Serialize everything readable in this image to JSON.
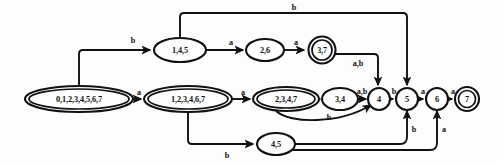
{
  "figure": {
    "colors": {
      "stroke": "#111111",
      "fill": "#ffffff",
      "background": "#fdfdfc"
    }
  },
  "alphabet": [
    "a",
    "b"
  ],
  "nodes": [
    {
      "id": "n0",
      "label": "0,1,2,3,4,5,6,7",
      "shape": "double-ellipse",
      "accepting": true,
      "cx": 79,
      "cy": 99,
      "rx": 54,
      "ry": 13
    },
    {
      "id": "n1",
      "label": "1,2,3,4,6,7",
      "shape": "double-ellipse",
      "accepting": true,
      "cx": 188,
      "cy": 99,
      "rx": 44,
      "ry": 13
    },
    {
      "id": "n2",
      "label": "2,3,4,7",
      "shape": "double-ellipse",
      "accepting": true,
      "cx": 286,
      "cy": 99,
      "rx": 33,
      "ry": 12
    },
    {
      "id": "n3",
      "label": "3,4",
      "shape": "ellipse",
      "accepting": false,
      "cx": 340,
      "cy": 99,
      "rx": 18,
      "ry": 11
    },
    {
      "id": "n4",
      "label": "4",
      "shape": "circle",
      "accepting": false,
      "cx": 379,
      "cy": 99,
      "rx": 11,
      "ry": 11
    },
    {
      "id": "n5",
      "label": "5",
      "shape": "circle",
      "accepting": false,
      "cx": 407,
      "cy": 99,
      "rx": 11,
      "ry": 11
    },
    {
      "id": "n6",
      "label": "6",
      "shape": "circle",
      "accepting": false,
      "cx": 437,
      "cy": 99,
      "rx": 11,
      "ry": 11
    },
    {
      "id": "n7",
      "label": "7",
      "shape": "double-circle",
      "accepting": true,
      "cx": 467,
      "cy": 99,
      "rx": 12,
      "ry": 12
    },
    {
      "id": "n8",
      "label": "1,4,5",
      "shape": "ellipse",
      "accepting": false,
      "cx": 180,
      "cy": 50,
      "rx": 26,
      "ry": 12
    },
    {
      "id": "n9",
      "label": "2,6",
      "shape": "ellipse",
      "accepting": false,
      "cx": 265,
      "cy": 50,
      "rx": 19,
      "ry": 11
    },
    {
      "id": "n10",
      "label": "3,7",
      "shape": "double-circle",
      "accepting": true,
      "cx": 322,
      "cy": 50,
      "rx": 14,
      "ry": 13
    },
    {
      "id": "n11",
      "label": "4,5",
      "shape": "ellipse",
      "accepting": false,
      "cx": 276,
      "cy": 144,
      "rx": 19,
      "ry": 11
    }
  ],
  "edges": [
    {
      "id": "e0",
      "from": "n0",
      "to": "n8",
      "label": "b",
      "label_x": 133,
      "label_y": 41
    },
    {
      "id": "e1",
      "from": "n0",
      "to": "n1",
      "label": "a",
      "label_x": 139,
      "label_y": 93
    },
    {
      "id": "e2",
      "from": "n1",
      "to": "n2",
      "label": "a",
      "label_x": 243,
      "label_y": 93
    },
    {
      "id": "e3",
      "from": "n2",
      "to": "n3",
      "label": "a",
      "label_x": 325,
      "label_y": 93
    },
    {
      "id": "e4",
      "from": "n3",
      "to": "n4",
      "label": "a,b",
      "label_x": 361,
      "label_y": 91
    },
    {
      "id": "e5",
      "from": "n4",
      "to": "n5",
      "label": "b",
      "label_x": 393,
      "label_y": 92
    },
    {
      "id": "e6",
      "from": "n5",
      "to": "n6",
      "label": "a",
      "label_x": 422,
      "label_y": 92
    },
    {
      "id": "e7",
      "from": "n6",
      "to": "n7",
      "label": "a",
      "label_x": 452,
      "label_y": 92
    },
    {
      "id": "e8",
      "from": "n8",
      "to": "n9",
      "label": "a",
      "label_x": 233,
      "label_y": 43
    },
    {
      "id": "e9",
      "from": "n9",
      "to": "n10",
      "label": "a",
      "label_x": 297,
      "label_y": 43
    },
    {
      "id": "e10",
      "from": "n10",
      "to": "n4",
      "label": "a,b",
      "label_x": 359,
      "label_y": 62
    },
    {
      "id": "e11",
      "from": "n8",
      "to": "n5",
      "label": "b",
      "label_x": 293,
      "label_y": 13
    },
    {
      "id": "e12",
      "from": "n2",
      "to": "n4",
      "label": "b",
      "label_x": 330,
      "label_y": 117
    },
    {
      "id": "e13",
      "from": "n1",
      "to": "n11",
      "label": "b",
      "label_x": 227,
      "label_y": 154
    },
    {
      "id": "e14",
      "from": "n11",
      "to": "n5",
      "label": "b",
      "label_x": 411,
      "label_y": 131
    },
    {
      "id": "e15",
      "from": "n11",
      "to": "n6",
      "label": "a",
      "label_x": 443,
      "label_y": 131
    }
  ],
  "paths": {
    "e0": "M 79 86 L 79 50 L 149 50",
    "e1": "M 133 99 L 141 99",
    "e2": "M 232 99 L 249 99",
    "e3": "M 319 99 L 319 99",
    "e3b": "M 319 99 L 319 99",
    "e4": "M 358 99 L 366 99",
    "e5": "M 390 99 L 394 99",
    "e6": "M 418 99 L 424 99",
    "e7": "M 448 99 L 453 99",
    "e8": "M 206 50 L 243 50",
    "e9": "M 284 50 L 306 50",
    "e10": "M 336 52 L 360 52 L 360 86",
    "e11": "M 180 38 L 180 12 L 407 12 L 407 86",
    "e12": "M 281 111 C 300 125 345 122 371 106",
    "e13": "M 188 112 L 188 144 L 254 144",
    "e14": "M 295 144 L 401 144 L 404 140 L 407 111",
    "e15": "M 295 147 L 430 147 L 434 142 L 437 111"
  }
}
